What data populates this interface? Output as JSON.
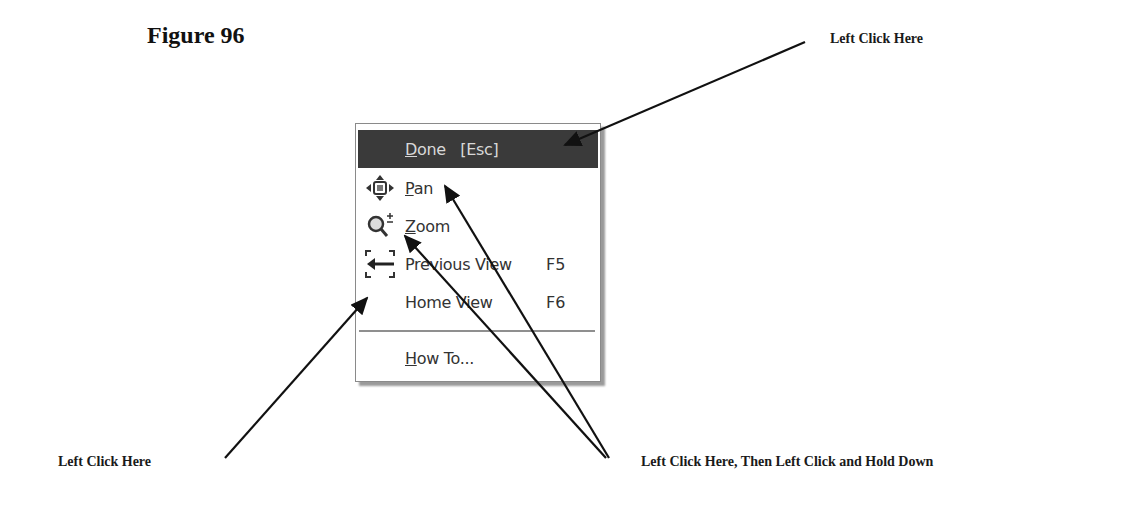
{
  "figure": {
    "title": "Figure 96"
  },
  "callouts": {
    "top_right": "Left Click Here",
    "bottom_left": "Left Click Here",
    "bottom_right": "Left Click Here, Then Left Click and Hold Down"
  },
  "menu": {
    "items": [
      {
        "id": "done",
        "label_prefix": "",
        "label_mnemonic": "D",
        "label_rest": "one   [Esc]",
        "shortcut": "",
        "icon": "none",
        "selected": true
      },
      {
        "id": "pan",
        "label_prefix": "",
        "label_mnemonic": "P",
        "label_rest": "an",
        "shortcut": "",
        "icon": "pan-arrows-icon",
        "selected": false
      },
      {
        "id": "zoom",
        "label_prefix": "",
        "label_mnemonic": "Z",
        "label_rest": "oom",
        "shortcut": "",
        "icon": "magnifier-plus-minus-icon",
        "selected": false
      },
      {
        "id": "previous-view",
        "label_prefix": "",
        "label_mnemonic": "",
        "label_rest": "Previous View",
        "shortcut": "F5",
        "icon": "previous-view-arrow-icon",
        "selected": false
      },
      {
        "id": "home-view",
        "label_prefix": "",
        "label_mnemonic": "",
        "label_rest": "Home View",
        "shortcut": "F6",
        "icon": "none",
        "selected": false
      },
      {
        "id": "how-to",
        "label_prefix": "",
        "label_mnemonic": "H",
        "label_rest": "ow To...",
        "shortcut": "",
        "icon": "none",
        "selected": false
      }
    ]
  },
  "colors": {
    "menu_selected_bg": "#3a3a3a",
    "menu_selected_text": "#d8d8d8",
    "menu_text": "#333333",
    "arrow": "#111111"
  }
}
